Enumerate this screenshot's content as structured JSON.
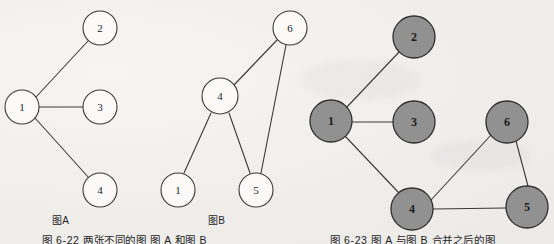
{
  "figure": {
    "background_color": "#f0efec",
    "node_fill_open": "#fbfaf8",
    "node_fill_merged": "#919191",
    "stroke_color": "#3a3a38"
  },
  "graph_a": {
    "caption": "图A",
    "nodes": [
      {
        "id": "a1",
        "label": "1",
        "cx": 22,
        "cy": 107,
        "r": 17
      },
      {
        "id": "a2",
        "label": "2",
        "cx": 100,
        "cy": 28,
        "r": 17
      },
      {
        "id": "a3",
        "label": "3",
        "cx": 100,
        "cy": 107,
        "r": 17
      },
      {
        "id": "a4",
        "label": "4",
        "cx": 100,
        "cy": 190,
        "r": 17
      }
    ],
    "edges": [
      {
        "from": "a1",
        "to": "a2"
      },
      {
        "from": "a1",
        "to": "a3"
      },
      {
        "from": "a1",
        "to": "a4"
      }
    ]
  },
  "graph_b": {
    "caption": "图B",
    "nodes": [
      {
        "id": "b4",
        "label": "4",
        "cx": 220,
        "cy": 96,
        "r": 18
      },
      {
        "id": "b6",
        "label": "6",
        "cx": 290,
        "cy": 28,
        "r": 17
      },
      {
        "id": "b1",
        "label": "1",
        "cx": 178,
        "cy": 190,
        "r": 17
      },
      {
        "id": "b5",
        "label": "5",
        "cx": 256,
        "cy": 190,
        "r": 17
      }
    ],
    "edges": [
      {
        "from": "b4",
        "to": "b6"
      },
      {
        "from": "b4",
        "to": "b1"
      },
      {
        "from": "b4",
        "to": "b5"
      },
      {
        "from": "b6",
        "to": "b5"
      }
    ]
  },
  "graph_merged": {
    "nodes": [
      {
        "id": "m1",
        "label": "1",
        "cx": 331,
        "cy": 121,
        "r": 21
      },
      {
        "id": "m2",
        "label": "2",
        "cx": 414,
        "cy": 37,
        "r": 21
      },
      {
        "id": "m3",
        "label": "3",
        "cx": 414,
        "cy": 122,
        "r": 21
      },
      {
        "id": "m4",
        "label": "4",
        "cx": 412,
        "cy": 209,
        "r": 21
      },
      {
        "id": "m5",
        "label": "5",
        "cx": 527,
        "cy": 207,
        "r": 21
      },
      {
        "id": "m6",
        "label": "6",
        "cx": 507,
        "cy": 122,
        "r": 21
      }
    ],
    "edges": [
      {
        "from": "m1",
        "to": "m2"
      },
      {
        "from": "m1",
        "to": "m3"
      },
      {
        "from": "m1",
        "to": "m4"
      },
      {
        "from": "m4",
        "to": "m6"
      },
      {
        "from": "m4",
        "to": "m5"
      },
      {
        "from": "m6",
        "to": "m5"
      }
    ]
  },
  "captions": {
    "figure_left": "图 6-22  两张不同的图  图 A 和图 B",
    "figure_right": "图 6-23  图 A 与图 B 合并之后的图"
  }
}
